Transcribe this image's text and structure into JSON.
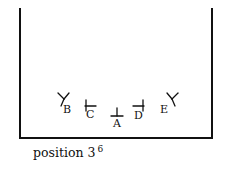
{
  "figure": {
    "caption_text": "position 3",
    "caption_superscript": "6",
    "stroke_color": "#111111",
    "background_color": "#ffffff",
    "container": {
      "name": "open-top-container",
      "left_wall_x": 19,
      "right_wall_x": 212,
      "bottom_y": 138,
      "top_y": 8
    },
    "markers": [
      {
        "id": "B",
        "label": "B",
        "glyph": "fork-left-icon",
        "glyph_description": "Y-shaped two-pronged tool tilted left",
        "x": 56,
        "y": 92,
        "label_x": 63,
        "label_y": 104
      },
      {
        "id": "C",
        "label": "C",
        "glyph": "tee-left-icon",
        "glyph_description": "horizontal bar with vertical tick at left end",
        "x": 84,
        "y": 99,
        "label_x": 86,
        "label_y": 109
      },
      {
        "id": "A",
        "label": "A",
        "glyph": "tee-up-icon",
        "glyph_description": "horizontal bar with vertical tick rising from center",
        "x": 110,
        "y": 106,
        "label_x": 113,
        "label_y": 118
      },
      {
        "id": "D",
        "label": "D",
        "glyph": "tee-right-icon",
        "glyph_description": "horizontal bar with vertical tick at right end",
        "x": 132,
        "y": 99,
        "label_x": 134,
        "label_y": 110
      },
      {
        "id": "E",
        "label": "E",
        "glyph": "fork-right-icon",
        "glyph_description": "Y-shaped two-pronged tool tilted right",
        "x": 166,
        "y": 92,
        "label_x": 160,
        "label_y": 104
      }
    ]
  }
}
